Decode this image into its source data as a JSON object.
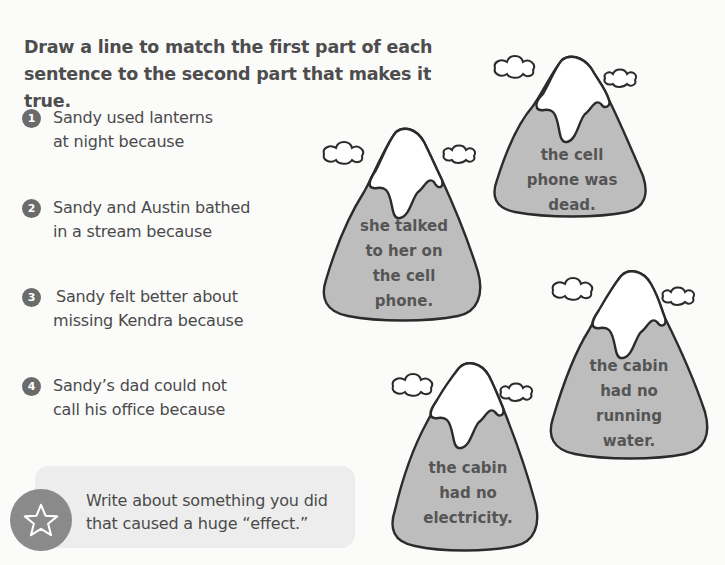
{
  "worksheet": {
    "instructions": {
      "line1": "Draw a line to match the first part of each",
      "line2": "sentence to the second part that makes it true."
    },
    "causes": [
      {
        "number": "1",
        "line1": "Sandy used lanterns",
        "line2": "at night because"
      },
      {
        "number": "2",
        "line1": "Sandy and Austin bathed",
        "line2": "in a stream because"
      },
      {
        "number": "3",
        "line1": "Sandy felt better about",
        "line2": "missing Kendra because"
      },
      {
        "number": "4",
        "line1": "Sandy’s dad could not",
        "line2": "call his office because"
      }
    ],
    "effects": [
      {
        "lines": [
          "the cell",
          "phone was",
          "dead."
        ]
      },
      {
        "lines": [
          "she talked",
          "to her on",
          "the cell",
          "phone."
        ]
      },
      {
        "lines": [
          "the cabin",
          "had no",
          "running",
          "water."
        ]
      },
      {
        "lines": [
          "the cabin",
          "had no",
          "electricity."
        ]
      }
    ],
    "prompt": {
      "icon": "star-icon",
      "line1": "Write about something you did",
      "line2": "that caused a huge “effect.”"
    }
  },
  "colors": {
    "mountain_fill": "#bdbdbd",
    "snow": "#ffffff",
    "outline": "#2b2b2b",
    "badge": "#6b6b6b",
    "prompt_box": "#ededed",
    "star_circle": "#8a8a8a"
  }
}
